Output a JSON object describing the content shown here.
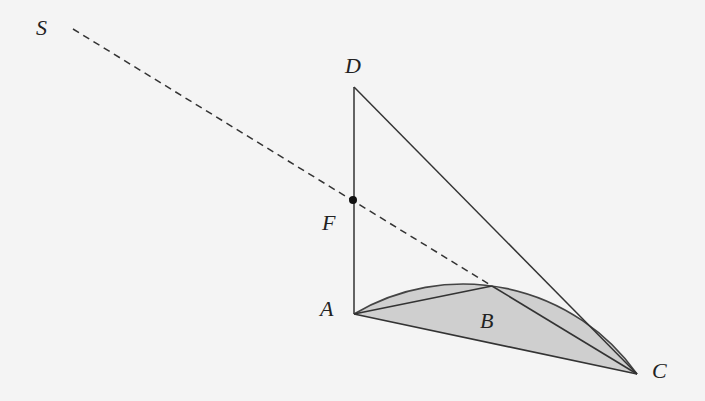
{
  "diagram": {
    "background": "#f4f4f4",
    "stroke_color": "#333333",
    "fill_color": "#cfcfcf",
    "points": {
      "S": {
        "label": "S",
        "x": 73,
        "y": 29,
        "label_x": 36,
        "label_y": 17
      },
      "D": {
        "label": "D",
        "x": 354,
        "y": 87,
        "label_x": 345,
        "label_y": 55
      },
      "F": {
        "label": "F",
        "x": 353,
        "y": 200,
        "label_x": 322,
        "label_y": 212
      },
      "A": {
        "label": "A",
        "x": 354,
        "y": 314,
        "label_x": 320,
        "label_y": 298
      },
      "B": {
        "label": "B",
        "x": 492,
        "y": 286,
        "label_x": 480,
        "label_y": 310
      },
      "C": {
        "label": "C",
        "x": 637,
        "y": 374,
        "label_x": 652,
        "label_y": 360
      }
    },
    "segments": [
      {
        "from": "A",
        "to": "D",
        "style": "solid"
      },
      {
        "from": "D",
        "to": "C",
        "style": "solid"
      },
      {
        "from": "A",
        "to": "B",
        "style": "solid"
      },
      {
        "from": "B",
        "to": "C",
        "style": "solid"
      },
      {
        "from": "A",
        "to": "C",
        "style": "solid"
      },
      {
        "from": "S",
        "to": "B",
        "style": "dashed",
        "passes_through": "F"
      }
    ],
    "arc": {
      "through": [
        "A",
        "B",
        "C"
      ],
      "shaded_segment": true
    },
    "marked_point": "F"
  }
}
